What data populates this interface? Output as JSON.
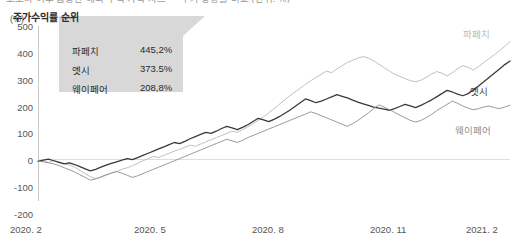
{
  "title": "코로나 이후 급등한 해외 주식 가격 차트 — 주가 상승률 비교 (단위: %)",
  "unit_label": "(%)",
  "callout": {
    "heading": "주가수익률 순위",
    "rows": [
      {
        "name": "파페치",
        "value": "445,2%"
      },
      {
        "name": "엣시",
        "value": "373.5%"
      },
      {
        "name": "웨이페어",
        "value": "208,8%"
      }
    ]
  },
  "series_labels": [
    {
      "name": "파페치",
      "color": "#b9b9b9"
    },
    {
      "name": "엣시",
      "color": "#3a3a3a"
    },
    {
      "name": "웨이페어",
      "color": "#8e8e8e"
    }
  ],
  "chart_data": {
    "type": "line",
    "title": "코로나 이후 급등한 해외 주식 가격 차트 — 주가 상승률 비교",
    "xlabel": "",
    "ylabel": "(%)",
    "ylim": [
      -200,
      500
    ],
    "ytick_labels": [
      "500",
      "400",
      "300",
      "200",
      "100",
      "0",
      "-100",
      "-200"
    ],
    "ytick_values": [
      500,
      400,
      300,
      200,
      100,
      0,
      -100,
      -200
    ],
    "xtick_labels": [
      "2020. 2",
      "2020. 5",
      "2020. 8",
      "2020. 11",
      "2021. 2"
    ],
    "xtick_positions": [
      0,
      0.25,
      0.5,
      0.75,
      1.0
    ],
    "grid": false,
    "legend_position": "line-end-labels",
    "series": [
      {
        "name": "파페치",
        "color": "#b9b9b9",
        "final_value": 445.2,
        "values": [
          0,
          2,
          -4,
          3,
          -2,
          -8,
          -14,
          -22,
          -34,
          -46,
          -58,
          -64,
          -60,
          -52,
          -44,
          -38,
          -30,
          -24,
          -16,
          -8,
          2,
          10,
          18,
          14,
          22,
          30,
          38,
          44,
          52,
          60,
          56,
          64,
          72,
          80,
          88,
          96,
          104,
          112,
          108,
          118,
          128,
          140,
          152,
          166,
          180,
          196,
          212,
          228,
          244,
          258,
          272,
          286,
          300,
          312,
          324,
          336,
          330,
          344,
          356,
          368,
          376,
          384,
          390,
          384,
          374,
          362,
          348,
          336,
          324,
          316,
          308,
          300,
          296,
          302,
          312,
          324,
          334,
          328,
          318,
          330,
          344,
          356,
          350,
          340,
          352,
          368,
          382,
          396,
          412,
          428,
          445.2
        ]
      },
      {
        "name": "엣시",
        "color": "#3a3a3a",
        "final_value": 373.5,
        "values": [
          0,
          4,
          8,
          2,
          -4,
          -10,
          -6,
          -12,
          -20,
          -28,
          -36,
          -30,
          -22,
          -14,
          -8,
          -2,
          4,
          10,
          6,
          14,
          22,
          30,
          38,
          46,
          54,
          62,
          70,
          66,
          74,
          84,
          92,
          100,
          108,
          104,
          112,
          122,
          130,
          124,
          118,
          126,
          136,
          148,
          160,
          154,
          148,
          156,
          166,
          178,
          190,
          204,
          218,
          232,
          226,
          218,
          224,
          232,
          240,
          248,
          242,
          236,
          228,
          220,
          214,
          208,
          202,
          198,
          194,
          190,
          196,
          204,
          212,
          206,
          200,
          208,
          218,
          228,
          240,
          252,
          264,
          258,
          250,
          244,
          252,
          266,
          280,
          296,
          312,
          328,
          344,
          360,
          373.5
        ]
      },
      {
        "name": "웨이페어",
        "color": "#8e8e8e",
        "final_value": 208.8,
        "values": [
          0,
          -2,
          -6,
          -10,
          -16,
          -24,
          -32,
          -40,
          -50,
          -60,
          -70,
          -66,
          -58,
          -50,
          -44,
          -38,
          -44,
          -52,
          -60,
          -54,
          -46,
          -38,
          -30,
          -22,
          -14,
          -6,
          2,
          10,
          18,
          26,
          34,
          42,
          50,
          58,
          66,
          74,
          82,
          76,
          70,
          78,
          88,
          96,
          104,
          112,
          120,
          128,
          136,
          144,
          152,
          160,
          168,
          176,
          184,
          178,
          170,
          162,
          154,
          146,
          138,
          130,
          140,
          152,
          166,
          180,
          196,
          210,
          202,
          192,
          182,
          172,
          162,
          152,
          146,
          152,
          162,
          174,
          188,
          200,
          212,
          224,
          216,
          206,
          198,
          192,
          196,
          202,
          206,
          200,
          196,
          202,
          208.8
        ]
      }
    ]
  }
}
